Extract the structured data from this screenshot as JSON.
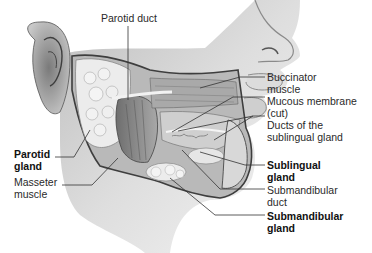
{
  "diagram": {
    "labels": {
      "parotid_duct": {
        "lines": [
          "Parotid duct"
        ],
        "bold": false
      },
      "buccinator_muscle": {
        "lines": [
          "Buccinator",
          "muscle"
        ],
        "bold": false
      },
      "mucous_membrane": {
        "lines": [
          "Mucous membrane",
          "(cut)"
        ],
        "bold": false
      },
      "ducts_sublingual": {
        "lines": [
          "Ducts of the",
          "sublingual gland"
        ],
        "bold": false
      },
      "parotid_gland": {
        "lines": [
          "Parotid",
          "gland"
        ],
        "bold": true
      },
      "masseter_muscle": {
        "lines": [
          "Masseter",
          "muscle"
        ],
        "bold": false
      },
      "sublingual_gland": {
        "lines": [
          "Sublingual",
          "gland"
        ],
        "bold": true
      },
      "submandibular_duct": {
        "lines": [
          "Submandibular",
          "duct"
        ],
        "bold": false
      },
      "submandibular_gland": {
        "lines": [
          "Submandibular",
          "gland"
        ],
        "bold": true
      }
    },
    "colors": {
      "skin": "#d9d9d9",
      "skin_shadow": "#9a9a9a",
      "gland": "#e8e8e8",
      "muscle": "#8c8c8c",
      "outline": "#4a4a4a",
      "leader_line": "#333333"
    }
  }
}
